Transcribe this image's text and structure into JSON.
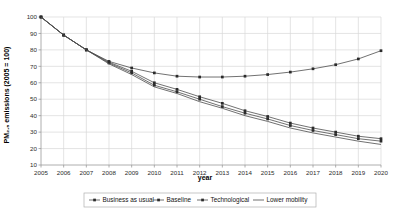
{
  "chart_data": {
    "type": "line",
    "title": "",
    "xlabel": "year",
    "ylabel": "PM2.5 emissions (2005 = 100)",
    "ylabel_display": "PM₂.₅ emissions (2005 = 100)",
    "x": [
      2005,
      2006,
      2007,
      2008,
      2009,
      2010,
      2011,
      2012,
      2013,
      2014,
      2015,
      2016,
      2017,
      2018,
      2019,
      2020
    ],
    "xtick_labels": [
      "2005",
      "2006",
      "2007",
      "2008",
      "2009",
      "2010",
      "2011",
      "2012",
      "2013",
      "2014",
      "2015",
      "2016",
      "2017",
      "2018",
      "2019",
      "2020"
    ],
    "ytick_labels": [
      "10",
      "20",
      "30",
      "40",
      "50",
      "60",
      "70",
      "80",
      "90",
      "100"
    ],
    "yticks": [
      10,
      20,
      30,
      40,
      50,
      60,
      70,
      80,
      90,
      100
    ],
    "ylim": [
      10,
      100
    ],
    "xlim": [
      2005,
      2020
    ],
    "grid": "horizontal-and-vertical-light",
    "legend_position": "bottom",
    "series": [
      {
        "name": "Business as usual",
        "marker": "square",
        "values": [
          100,
          89,
          80,
          73,
          69,
          66,
          64,
          63.5,
          63.5,
          64,
          65,
          66.5,
          68.5,
          71,
          74.5,
          79.5
        ]
      },
      {
        "name": "Baseline",
        "marker": "square",
        "values": [
          100,
          89,
          80,
          72.5,
          67,
          60,
          56,
          51.5,
          47.5,
          43,
          39.5,
          35.5,
          32.5,
          30,
          27.5,
          26
        ]
      },
      {
        "name": "Technological",
        "marker": "square",
        "values": [
          100,
          89,
          80,
          72,
          66,
          58.5,
          54.5,
          50,
          45.5,
          41.5,
          38,
          34,
          31,
          28.5,
          26,
          24.5
        ]
      },
      {
        "name": "Lower mobility",
        "marker": "none",
        "values": [
          100,
          89,
          80,
          71.5,
          65,
          57.5,
          53.5,
          48.5,
          44.5,
          40,
          36.5,
          32.5,
          29.5,
          27,
          24.5,
          22.5
        ]
      }
    ],
    "colors": {
      "line": "#4d4d4d",
      "marker": "#2b2b2b",
      "grid": "#d9d9d9",
      "axis": "#9a9a9a",
      "text": "#141414"
    }
  }
}
